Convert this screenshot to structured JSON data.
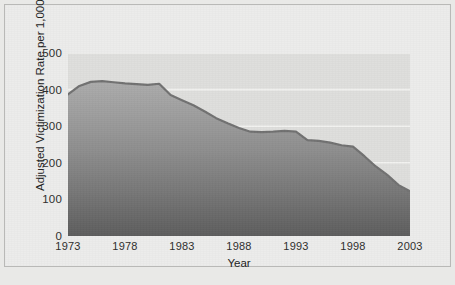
{
  "figure": {
    "background_color": "#ececeb",
    "plot_background_color": "#dededc",
    "gridline_color": "#f2f2f0",
    "line_color": "#6f6f6f",
    "fill_top_color": "#a9a9a9",
    "fill_bottom_color": "#5e5e5e"
  },
  "chart_data": {
    "type": "area",
    "title": "",
    "subtitle": "",
    "xlabel": "Year",
    "ylabel": "Adjusted Victimization Rate per 1,000 Households",
    "xlim": [
      1973,
      2003
    ],
    "ylim": [
      0,
      500
    ],
    "grid": true,
    "legend": null,
    "legend_position": "none",
    "y_ticks": [
      0,
      100,
      200,
      300,
      400,
      500
    ],
    "y_tick_labels": [
      "0",
      "100",
      "200",
      "300",
      "400",
      "500"
    ],
    "x_ticks": [
      1973,
      1978,
      1983,
      1988,
      1993,
      1998,
      2003
    ],
    "x_tick_labels": [
      "1973",
      "1978",
      "1983",
      "1988",
      "1993",
      "1998",
      "2003"
    ],
    "x": [
      1973,
      1974,
      1975,
      1976,
      1977,
      1978,
      1979,
      1980,
      1981,
      1982,
      1983,
      1984,
      1985,
      1986,
      1987,
      1988,
      1989,
      1990,
      1991,
      1992,
      1993,
      1994,
      1995,
      1996,
      1997,
      1998,
      1999,
      2000,
      2001,
      2002,
      2003
    ],
    "values": [
      387,
      410,
      421,
      423,
      420,
      417,
      415,
      413,
      416,
      385,
      371,
      357,
      340,
      322,
      308,
      295,
      285,
      284,
      285,
      287,
      285,
      262,
      260,
      255,
      248,
      244,
      218,
      190,
      167,
      139,
      122
    ],
    "series": [
      {
        "name": "Adjusted victimization rate per 1,000 households",
        "values": [
          387,
          410,
          421,
          423,
          420,
          417,
          415,
          413,
          416,
          385,
          371,
          357,
          340,
          322,
          308,
          295,
          285,
          284,
          285,
          287,
          285,
          262,
          260,
          255,
          248,
          244,
          218,
          190,
          167,
          139,
          122
        ]
      }
    ]
  }
}
